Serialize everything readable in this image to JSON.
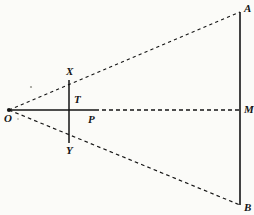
{
  "figure": {
    "canvas": {
      "width": 254,
      "height": 215
    },
    "background_color": "#fbfbf8",
    "ink_color": "#151515",
    "points": [
      {
        "id": "O",
        "label": "O",
        "x": 9,
        "y": 110,
        "label_x": 4,
        "label_y": 119,
        "vertex_dot": true
      },
      {
        "id": "X",
        "label": "X",
        "x": 69,
        "y": 80,
        "label_x": 66,
        "label_y": 72,
        "vertex_dot": false
      },
      {
        "id": "T",
        "label": "T",
        "x": 69,
        "y": 110,
        "label_x": 74,
        "label_y": 100,
        "vertex_dot": false
      },
      {
        "id": "Y",
        "label": "Y",
        "x": 69,
        "y": 143,
        "label_x": 66,
        "label_y": 151,
        "vertex_dot": false
      },
      {
        "id": "P",
        "label": "P",
        "x": 95,
        "y": 110,
        "label_x": 88,
        "label_y": 120,
        "vertex_dot": false
      },
      {
        "id": "A",
        "label": "A",
        "x": 240,
        "y": 12,
        "label_x": 244,
        "label_y": 9,
        "vertex_dot": false
      },
      {
        "id": "M",
        "label": "M",
        "x": 240,
        "y": 110,
        "label_x": 244,
        "label_y": 110,
        "vertex_dot": false
      },
      {
        "id": "B",
        "label": "B",
        "x": 240,
        "y": 205,
        "label_x": 244,
        "label_y": 208,
        "vertex_dot": false
      }
    ],
    "segments": [
      {
        "id": "ray-O-A",
        "name": "upper-ray-OA",
        "from": "O",
        "to": "A",
        "style": "dashed",
        "dash": "3.2 3.2",
        "width": 1.1
      },
      {
        "id": "ray-O-B",
        "name": "lower-ray-OB",
        "from": "O",
        "to": "B",
        "style": "dashed",
        "dash": "3.6 3.2",
        "width": 1.2
      },
      {
        "id": "axis-O-P",
        "name": "axis-solid-OP",
        "from": "O",
        "to": "P",
        "style": "solid",
        "dash": "",
        "width": 1.5
      },
      {
        "id": "axis-P-M",
        "name": "axis-dashed-PM",
        "from": "P",
        "to": "M",
        "style": "dashed",
        "dash": "4 3",
        "width": 1.5
      },
      {
        "id": "chord-X-Y",
        "name": "chord-XY",
        "from": "X",
        "to": "Y",
        "style": "solid",
        "dash": "",
        "width": 1.5
      },
      {
        "id": "chord-A-B",
        "name": "chord-AB",
        "from": "A",
        "to": "B",
        "style": "solid",
        "dash": "",
        "width": 1.6
      }
    ],
    "specks": [
      {
        "id": "speck-1",
        "x": 31,
        "y": 87,
        "r": 1.1
      },
      {
        "id": "speck-2",
        "x": 18,
        "y": 119,
        "r": 0.8
      }
    ]
  }
}
